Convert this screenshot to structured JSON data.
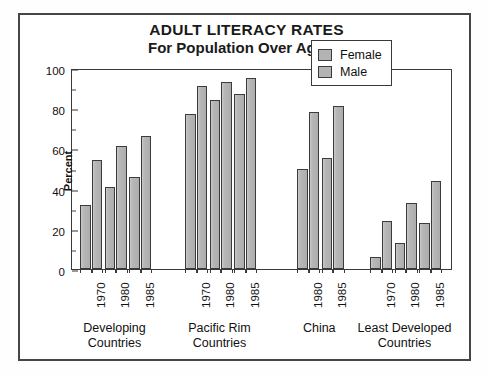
{
  "chart_data": {
    "type": "bar",
    "title": "ADULT LITERACY RATES",
    "subtitle": "For Population Over Age 14",
    "xlabel": "",
    "ylabel": "Percent",
    "ylim": [
      0,
      100
    ],
    "ytick_labels": [
      "0",
      "20",
      "40",
      "60",
      "80",
      "100"
    ],
    "ytick_values": [
      0,
      20,
      40,
      60,
      80,
      100
    ],
    "yminor_values": [
      10,
      30,
      50,
      70,
      90
    ],
    "grid": false,
    "legend_position": "top-right",
    "legend": [
      "Female",
      "Male"
    ],
    "series": [
      {
        "name": "Female",
        "color": "#b3b3b3"
      },
      {
        "name": "Male",
        "color": "#b3b3b3"
      }
    ],
    "groups": [
      {
        "label_line1": "Developing",
        "label_line2": "Countries",
        "years": [
          "1970",
          "1980",
          "1985"
        ],
        "female": [
          32,
          41,
          46
        ],
        "male": [
          54,
          61,
          66
        ]
      },
      {
        "label_line1": "Pacific Rim",
        "label_line2": "Countries",
        "years": [
          "1970",
          "1980",
          "1985"
        ],
        "female": [
          77,
          84,
          87
        ],
        "male": [
          91,
          93,
          95
        ]
      },
      {
        "label_line1": "China",
        "label_line2": "",
        "years": [
          "1980",
          "1985"
        ],
        "female": [
          50,
          55
        ],
        "male": [
          78,
          81
        ]
      },
      {
        "label_line1": "Least Developed",
        "label_line2": "Countries",
        "years": [
          "1970",
          "1980",
          "1985"
        ],
        "female": [
          6,
          13,
          23
        ],
        "male": [
          24,
          33,
          44
        ]
      }
    ]
  }
}
